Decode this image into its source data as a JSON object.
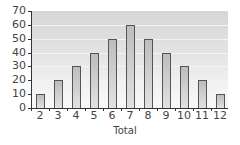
{
  "chart_data": {
    "type": "bar",
    "title": "",
    "xlabel": "Total",
    "ylabel": "",
    "categories": [
      "2",
      "3",
      "4",
      "5",
      "6",
      "7",
      "8",
      "9",
      "10",
      "11",
      "12"
    ],
    "values": [
      10,
      20,
      30,
      40,
      50,
      60,
      50,
      40,
      30,
      20,
      10
    ],
    "ylim": [
      0,
      70
    ],
    "yticks": [
      0,
      10,
      20,
      30,
      40,
      50,
      60,
      70
    ],
    "grid": true,
    "legend": "none",
    "colors": {
      "bar_fill_top": "#bdbdbd",
      "bar_fill_bottom": "#e2e2e2",
      "bar_border": "#555555",
      "plot_bg_top": "#d6d6d6",
      "plot_bg_bottom": "#fafafa",
      "axis": "#333333",
      "text": "#444444"
    }
  }
}
